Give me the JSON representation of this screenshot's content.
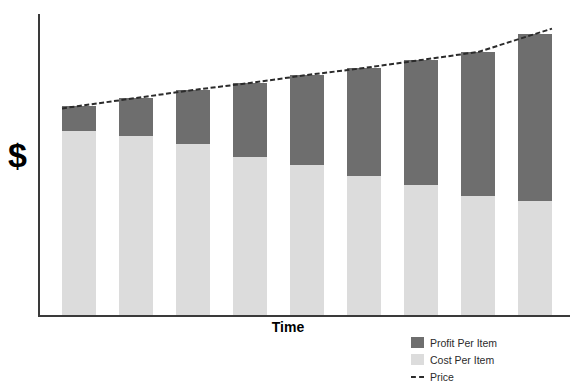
{
  "chart_data": {
    "type": "bar",
    "title": "",
    "subtitle": "",
    "xlabel": "Time",
    "ylabel": "$",
    "stacked": true,
    "grid": false,
    "legend_position": "bottom-right",
    "xlim_note": "Time axis has no tick labels",
    "ylim_note": "Dollar axis has no tick labels",
    "categories": [
      "1",
      "2",
      "3",
      "4",
      "5",
      "6",
      "7",
      "8",
      "9"
    ],
    "series": [
      {
        "name": "Profit Per Item",
        "color": "#6e6e6e",
        "values": [
          25,
          38,
          54,
          74,
          90,
          108,
          125,
          144,
          167
        ]
      },
      {
        "name": "Cost Per Item",
        "color": "#dcdcdc",
        "values": [
          184,
          179,
          171,
          158,
          150,
          139,
          130,
          119,
          114
        ]
      }
    ],
    "overlay_line": {
      "name": "Price",
      "color": "#2b2b2b",
      "style": "dashed",
      "values": [
        209,
        217,
        225,
        232,
        240,
        247,
        255,
        263,
        281
      ]
    },
    "totals": [
      209,
      217,
      225,
      232,
      240,
      247,
      255,
      263,
      281
    ],
    "annotations": []
  },
  "axes": {
    "y_title": "$",
    "x_title": "Time"
  },
  "legend": {
    "items": [
      {
        "label": "Profit Per Item",
        "swatch": "profit-swatch"
      },
      {
        "label": "Cost Per Item",
        "swatch": "cost-swatch"
      },
      {
        "label": "Price",
        "swatch": "price-line-swatch"
      }
    ]
  },
  "colors": {
    "profit": "#6e6e6e",
    "cost": "#dcdcdc",
    "price_line": "#2b2b2b",
    "axis": "#3a3a3a",
    "background": "#ffffff",
    "text": "#000000"
  }
}
